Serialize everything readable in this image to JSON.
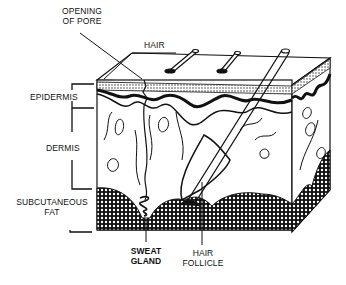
{
  "diagram": {
    "labels": {
      "opening_of_pore": [
        "OPENING",
        "OF PORE"
      ],
      "hair": "HAIR",
      "epidermis": "EPIDERMIS",
      "dermis": "DERMIS",
      "subcutaneous_fat": [
        "SUBCUTANEOUS",
        "FAT"
      ],
      "sweat_gland": [
        "SWEAT",
        "GLAND"
      ],
      "hair_follicle": [
        "HAIR",
        "FOLLICLE"
      ]
    },
    "colors": {
      "ink": "#111111",
      "background": "#ffffff"
    }
  }
}
